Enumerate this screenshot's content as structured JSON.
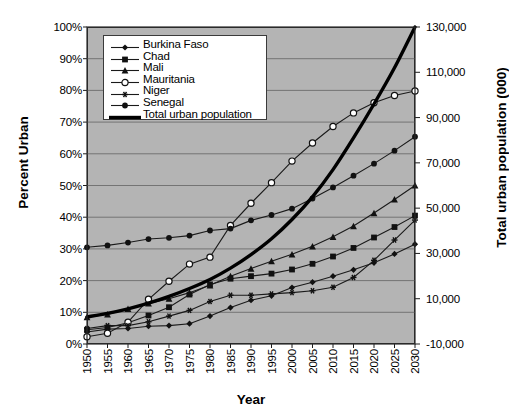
{
  "chart_data": {
    "type": "line",
    "title": "",
    "xlabel": "Year",
    "ylabel": "Percent Urban",
    "y2label": "Total urban population (000)",
    "grid": true,
    "legend_position": "upper-left-inside",
    "x": [
      1950,
      1955,
      1960,
      1965,
      1970,
      1975,
      1980,
      1985,
      1990,
      1995,
      2000,
      2005,
      2010,
      2015,
      2020,
      2025,
      2030
    ],
    "xticklabels": [
      "1950",
      "1955",
      "1960",
      "1965",
      "1970",
      "1975",
      "1980",
      "1985",
      "1990",
      "1995",
      "2000",
      "2005",
      "2010",
      "2015",
      "2020",
      "2025",
      "2030"
    ],
    "ylim": [
      0,
      100
    ],
    "yticklabels": [
      "0%",
      "10%",
      "20%",
      "30%",
      "40%",
      "50%",
      "60%",
      "70%",
      "80%",
      "90%",
      "100%"
    ],
    "yticks": [
      0,
      10,
      20,
      30,
      40,
      50,
      60,
      70,
      80,
      90,
      100
    ],
    "y2lim": [
      -10000,
      130000
    ],
    "y2ticks": [
      -10000,
      10000,
      30000,
      50000,
      70000,
      90000,
      110000,
      130000
    ],
    "y2ticklabels": [
      "-10,000",
      "10,000",
      "30,000",
      "50,000",
      "70,000",
      "90,000",
      "110,000",
      "130,000"
    ],
    "series": [
      {
        "name": "Burkina Faso",
        "marker": "diamond",
        "axis": "left",
        "values": [
          3.8,
          4.7,
          4.9,
          5.6,
          5.8,
          6.4,
          8.8,
          11.5,
          13.8,
          15.2,
          17.8,
          19.5,
          21.4,
          23.4,
          25.6,
          28.4,
          31.5
        ]
      },
      {
        "name": "Chad",
        "marker": "square",
        "axis": "left",
        "values": [
          4.5,
          5.2,
          6.7,
          9.0,
          11.6,
          15.6,
          18.8,
          20.6,
          21.4,
          22.2,
          23.5,
          25.3,
          27.6,
          30.3,
          33.6,
          36.9,
          40.5
        ]
      },
      {
        "name": "Mali",
        "marker": "triangle",
        "axis": "left",
        "values": [
          8.5,
          9.3,
          11.1,
          12.8,
          14.3,
          16.2,
          18.5,
          21.4,
          23.8,
          26.1,
          28.3,
          30.8,
          33.8,
          37.2,
          41.3,
          45.6,
          50.0
        ]
      },
      {
        "name": "Mauritania",
        "marker": "open-circle",
        "axis": "left",
        "values": [
          2.3,
          3.4,
          6.9,
          14.1,
          19.8,
          25.2,
          27.4,
          37.4,
          44.4,
          50.9,
          57.7,
          63.4,
          68.6,
          72.9,
          76.1,
          78.4,
          79.8
        ]
      },
      {
        "name": "Niger",
        "marker": "star",
        "axis": "left",
        "values": [
          4.9,
          5.8,
          5.8,
          7.0,
          8.8,
          10.6,
          13.4,
          15.4,
          15.4,
          15.8,
          16.2,
          16.8,
          17.9,
          21.0,
          26.4,
          32.8,
          39.1
        ]
      },
      {
        "name": "Senegal",
        "marker": "circle",
        "axis": "left",
        "values": [
          30.5,
          31.1,
          32.0,
          33.1,
          33.5,
          34.2,
          35.8,
          36.4,
          39.0,
          40.7,
          42.7,
          45.9,
          49.4,
          53.1,
          56.9,
          61.0,
          65.4
        ]
      },
      {
        "name": "Total  urban population",
        "marker": "none",
        "axis": "right",
        "thick": true,
        "values": [
          2000,
          3500,
          5500,
          8000,
          11000,
          14500,
          18500,
          23500,
          29500,
          36500,
          45000,
          55000,
          67000,
          81000,
          96000,
          112000,
          130000
        ]
      }
    ]
  },
  "legend": {
    "items": [
      {
        "label": "Burkina Faso"
      },
      {
        "label": "Chad"
      },
      {
        "label": "Mali"
      },
      {
        "label": "Mauritania"
      },
      {
        "label": "Niger"
      },
      {
        "label": "Senegal"
      },
      {
        "label": "Total  urban population"
      }
    ]
  }
}
